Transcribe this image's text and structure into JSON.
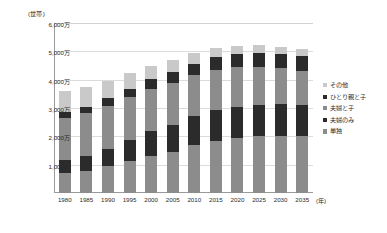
{
  "chart_data": {
    "type": "bar",
    "stacked": true,
    "title": "",
    "xlabel": "年",
    "ylabel": "世帯",
    "y_unit_caption": "(世帯)",
    "x_unit_caption": "(年)",
    "grid": true,
    "legend_position": "right",
    "ylim": [
      0,
      60000000
    ],
    "ytick_labels": [
      "6,000万",
      "5,000万",
      "4,000万",
      "3,000万",
      "2,000万",
      "1,000万"
    ],
    "ytick_values": [
      60000000,
      50000000,
      40000000,
      30000000,
      20000000,
      10000000
    ],
    "categories": [
      "1980",
      "1985",
      "1990",
      "1995",
      "2000",
      "2005",
      "2010",
      "2015",
      "2020",
      "2025",
      "2030",
      "2035"
    ],
    "series": [
      {
        "name": "単独",
        "color": "#8c8c8c",
        "values": [
          7105000,
          7895000,
          9390000,
          11239000,
          12911000,
          14457000,
          16785000,
          18418000,
          19342000,
          19960000,
          20254000,
          20233000
        ]
      },
      {
        "name": "夫婦のみ",
        "color": "#2b2b2b",
        "values": [
          4460000,
          5212000,
          6273000,
          7619000,
          8823000,
          9637000,
          10269000,
          10718000,
          11101000,
          11191000,
          11019000,
          10707000
        ]
      },
      {
        "name": "夫婦と子",
        "color": "#8c8c8c",
        "values": [
          15081000,
          15189000,
          15172000,
          15032000,
          14919000,
          14646000,
          14440000,
          14288000,
          13949000,
          13438000,
          12866000,
          12254000
        ]
      },
      {
        "name": "ひとり親と子",
        "color": "#2b2b2b",
        "values": [
          1908000,
          2226000,
          2586000,
          2964000,
          3435000,
          3837000,
          4160000,
          4523000,
          4753000,
          4913000,
          4995000,
          5018000
        ]
      },
      {
        "name": "その他",
        "color": "#c9c9c9",
        "values": [
          7460000,
          6894000,
          6249000,
          5601000,
          4823000,
          4329000,
          3693000,
          3233000,
          2916000,
          2693000,
          2556000,
          2459000
        ]
      }
    ],
    "legend_entries": [
      {
        "label": "その他",
        "color": "#c9c9c9"
      },
      {
        "label": "ひとり親と子",
        "color": "#2b2b2b"
      },
      {
        "label": "夫婦と子",
        "color": "#8c8c8c"
      },
      {
        "label": "夫婦のみ",
        "color": "#2b2b2b"
      },
      {
        "label": "単独",
        "color": "#8c8c8c"
      }
    ]
  }
}
